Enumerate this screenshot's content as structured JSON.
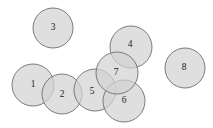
{
  "figure": {
    "background_color": "#ffffff",
    "width": 213,
    "height": 128
  },
  "style": {
    "circle_fill": "#d2d2d2",
    "circle_fill_opacity": 0.72,
    "circle_stroke": "#6e6e6e",
    "circle_stroke_width": 0.9,
    "label_color": "#1a1a1a",
    "label_font_size": 9.5
  },
  "chart_data": {
    "type": "scatter",
    "xlabel": "",
    "ylabel": "",
    "xlim": [
      0,
      213
    ],
    "ylim": [
      0,
      128
    ],
    "grid": false,
    "legend": "none",
    "circles": [
      {
        "label": "1",
        "cx": 33,
        "cy": 85,
        "r": 21,
        "label_x": 33,
        "label_y": 85
      },
      {
        "label": "2",
        "cx": 62,
        "cy": 94,
        "r": 20,
        "label_x": 62,
        "label_y": 95
      },
      {
        "label": "3",
        "cx": 53,
        "cy": 28,
        "r": 20,
        "label_x": 53,
        "label_y": 28
      },
      {
        "label": "4",
        "cx": 131,
        "cy": 47,
        "r": 21,
        "label_x": 130,
        "label_y": 45
      },
      {
        "label": "5",
        "cx": 95,
        "cy": 90,
        "r": 21,
        "label_x": 92,
        "label_y": 92
      },
      {
        "label": "6",
        "cx": 124,
        "cy": 101,
        "r": 21,
        "label_x": 124,
        "label_y": 101
      },
      {
        "label": "7",
        "cx": 117,
        "cy": 73,
        "r": 21,
        "label_x": 116,
        "label_y": 73
      },
      {
        "label": "8",
        "cx": 185,
        "cy": 68,
        "r": 20,
        "label_x": 184,
        "label_y": 68
      }
    ]
  }
}
